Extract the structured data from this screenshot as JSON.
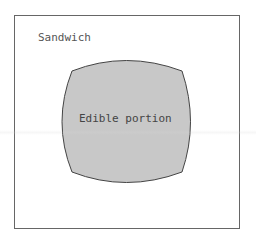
{
  "diagram": {
    "outer_label": "Sandwich",
    "inner_label": "Edible portion",
    "colors": {
      "outer_border": "#666666",
      "inner_fill": "#c8c8c8",
      "inner_stroke": "#444444",
      "text": "#555555"
    }
  }
}
